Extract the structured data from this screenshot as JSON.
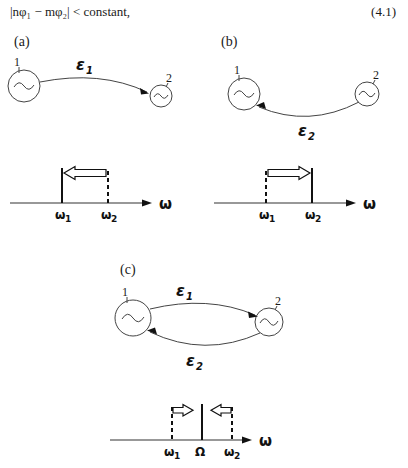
{
  "equation": {
    "expression": "|nφ₁ − mφ₂| < constant,",
    "number": "(4.1)"
  },
  "panels": [
    {
      "key": "a",
      "label": "(a)",
      "oscillators": [
        {
          "id": "left",
          "number": "1",
          "glyph": "~"
        },
        {
          "id": "right",
          "number": "2",
          "glyph": "~"
        }
      ],
      "couplings": [
        {
          "name": "epsilon-1",
          "symbol": "ε",
          "subscript": "1",
          "direction": "left-to-right"
        }
      ],
      "axis": {
        "name": "ω",
        "ticks": [
          {
            "symbol": "ω",
            "subscript": "1",
            "style": "solid"
          },
          {
            "symbol": "ω",
            "subscript": "2",
            "style": "dashed"
          }
        ],
        "pull": {
          "direction": "left",
          "from": "ω₂",
          "to": "ω₁"
        }
      }
    },
    {
      "key": "b",
      "label": "(b)",
      "oscillators": [
        {
          "id": "left",
          "number": "1",
          "glyph": "~"
        },
        {
          "id": "right",
          "number": "2",
          "glyph": "~"
        }
      ],
      "couplings": [
        {
          "name": "epsilon-2",
          "symbol": "ε",
          "subscript": "2",
          "direction": "right-to-left"
        }
      ],
      "axis": {
        "name": "ω",
        "ticks": [
          {
            "symbol": "ω",
            "subscript": "1",
            "style": "dashed"
          },
          {
            "symbol": "ω",
            "subscript": "2",
            "style": "solid"
          }
        ],
        "pull": {
          "direction": "right",
          "from": "ω₁",
          "to": "ω₂"
        }
      }
    },
    {
      "key": "c",
      "label": "(c)",
      "oscillators": [
        {
          "id": "left",
          "number": "1",
          "glyph": "~"
        },
        {
          "id": "right",
          "number": "2",
          "glyph": "~"
        }
      ],
      "couplings": [
        {
          "name": "epsilon-1",
          "symbol": "ε",
          "subscript": "1",
          "direction": "left-to-right"
        },
        {
          "name": "epsilon-2",
          "symbol": "ε",
          "subscript": "2",
          "direction": "right-to-left"
        }
      ],
      "axis": {
        "name": "ω",
        "ticks": [
          {
            "symbol": "ω",
            "subscript": "1",
            "style": "dashed"
          },
          {
            "symbol": "Ω",
            "subscript": "",
            "style": "solid"
          },
          {
            "symbol": "ω",
            "subscript": "2",
            "style": "dashed"
          }
        ],
        "pull": {
          "direction": "inward",
          "from": "ω₁ and ω₂",
          "to": "Ω"
        }
      }
    }
  ],
  "colors": {
    "background": "#ffffff",
    "ink": "#111111",
    "line": "#444444"
  }
}
